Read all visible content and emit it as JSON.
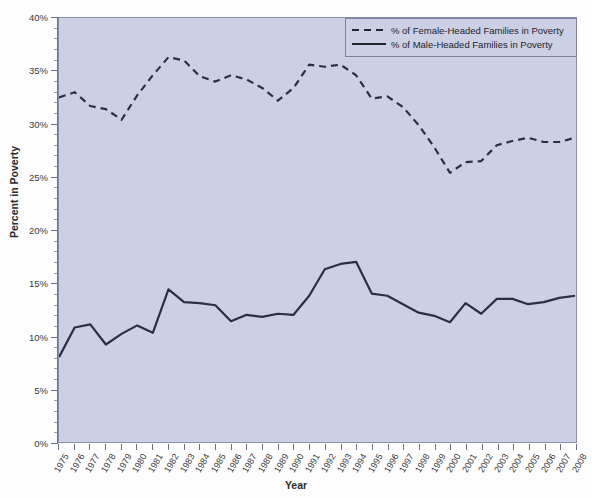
{
  "chart_data": {
    "type": "line",
    "title": "",
    "xlabel": "Year",
    "ylabel": "Percent in Poverty",
    "xlim": [
      1975,
      2008
    ],
    "ylim": [
      0,
      40
    ],
    "ytick_labels": [
      "0%",
      "5%",
      "10%",
      "15%",
      "20%",
      "25%",
      "30%",
      "35%",
      "40%"
    ],
    "ytick_values": [
      0,
      5,
      10,
      15,
      20,
      25,
      30,
      35,
      40
    ],
    "y_minor_interval": 1,
    "grid": false,
    "legend_position": "top-right",
    "categories": [
      "1975",
      "1976",
      "1977",
      "1978",
      "1979",
      "1980",
      "1981",
      "1982",
      "1983",
      "1984",
      "1985",
      "1986",
      "1987",
      "1988",
      "1989",
      "1990",
      "1991",
      "1992",
      "1993",
      "1994",
      "1995",
      "1996",
      "1997",
      "1998",
      "1999",
      "2000",
      "2001",
      "2002",
      "2003",
      "2004",
      "2005",
      "2006",
      "2007",
      "2008"
    ],
    "series": [
      {
        "name": "% of Female-Headed Families in Poverty",
        "style": "dashed",
        "color": "#2b2f45",
        "values": [
          32.5,
          33.0,
          31.7,
          31.4,
          30.4,
          32.7,
          34.6,
          36.3,
          36.0,
          34.5,
          34.0,
          34.6,
          34.2,
          33.4,
          32.2,
          33.4,
          35.6,
          35.4,
          35.6,
          34.6,
          32.4,
          32.6,
          31.6,
          29.9,
          27.8,
          25.4,
          26.4,
          26.5,
          28.0,
          28.4,
          28.7,
          28.3,
          28.3,
          28.7
        ]
      },
      {
        "name": "% of Male-Headed Families in Poverty",
        "style": "solid",
        "color": "#2b2f45",
        "values": [
          8.0,
          10.8,
          11.1,
          9.2,
          10.2,
          11.0,
          10.3,
          14.4,
          13.2,
          13.1,
          12.9,
          11.4,
          12.0,
          11.8,
          12.1,
          12.0,
          13.8,
          16.3,
          16.8,
          17.0,
          14.0,
          13.8,
          13.0,
          12.2,
          11.9,
          11.3,
          13.1,
          12.1,
          13.5,
          13.5,
          13.0,
          13.2,
          13.6,
          13.8
        ]
      }
    ]
  },
  "legend": {
    "entries": [
      {
        "label": "% of Female-Headed Families in Poverty",
        "style": "dashed"
      },
      {
        "label": "% of Male-Headed Families in Poverty",
        "style": "solid"
      }
    ]
  },
  "axes": {
    "x_title": "Year",
    "y_title": "Percent in Poverty"
  },
  "colors": {
    "plot_background": "#ccd0e4",
    "page_background": "#fdfdfd",
    "line": "#2b2f45",
    "axis": "#6c6f86"
  }
}
